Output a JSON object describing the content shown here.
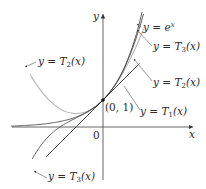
{
  "figure": {
    "axes": {
      "x_label": "x",
      "y_label": "y",
      "origin_label": "0"
    },
    "point": {
      "label": "(0, 1)"
    },
    "curves": [
      {
        "id": "ex",
        "y": "y = ",
        "fn": "e",
        "sup": "x",
        "color": "#4a4a4a"
      },
      {
        "id": "T3",
        "y": "y = ",
        "fn": "T",
        "sub": "3",
        "arg": "(x)",
        "color": "#4a4a4a"
      },
      {
        "id": "T2",
        "y": "y = ",
        "fn": "T",
        "sub": "2",
        "arg": "(x)",
        "color": "#b5b5b5"
      },
      {
        "id": "T1",
        "y": "y = ",
        "fn": "T",
        "sub": "1",
        "arg": "(x)",
        "color": "#1a1a1a"
      }
    ],
    "labels": {
      "t2_left": {
        "y": "y = ",
        "fn": "T",
        "sub": "2",
        "arg": "(x)"
      },
      "ex": {
        "y": "y = ",
        "fn": "e",
        "sup": "x"
      },
      "t3_right": {
        "y": "y = ",
        "fn": "T",
        "sub": "3",
        "arg": "(x)"
      },
      "t2_right": {
        "y": "y = ",
        "fn": "T",
        "sub": "2",
        "arg": "(x)"
      },
      "t1": {
        "y": "y = ",
        "fn": "T",
        "sub": "1",
        "arg": "(x)"
      },
      "t3_bottom": {
        "y": "y = ",
        "fn": "T",
        "sub": "3",
        "arg": "(x)"
      }
    }
  },
  "chart_data": {
    "type": "line",
    "title": "",
    "xlabel": "x",
    "ylabel": "y",
    "xlim": [
      -3.4,
      3.3
    ],
    "ylim": [
      -1.9,
      4.3
    ],
    "annotations": [
      "(0, 1)"
    ],
    "series": [
      {
        "name": "y = e^x",
        "formula": "e^x"
      },
      {
        "name": "y = T1(x)",
        "formula": "1 + x"
      },
      {
        "name": "y = T2(x)",
        "formula": "1 + x + x^2/2"
      },
      {
        "name": "y = T3(x)",
        "formula": "1 + x + x^2/2 + x^3/6"
      }
    ]
  }
}
